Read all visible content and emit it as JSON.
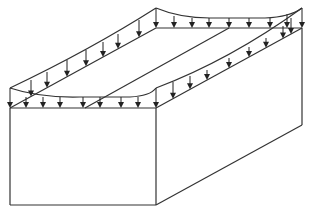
{
  "diagram": {
    "colors": {
      "stroke": "#333333",
      "background": "#ffffff"
    },
    "box": {
      "front_face": {
        "x1": 10,
        "y1": 108,
        "x2": 156,
        "y2": 205
      },
      "depth_offset": {
        "dx": 146,
        "dy": -80
      }
    },
    "mid_line": {
      "x1": 85,
      "y1": 108,
      "x2": 229,
      "y2": 28
    },
    "load_curves": [
      {
        "name": "front-load-curve",
        "d": "M10,88 Q40,98 80,97 L130,97 Q150,96 156,88"
      },
      {
        "name": "left-load-curve",
        "d": "M10,88 Q90,50 156,8"
      },
      {
        "name": "back-load-curve",
        "d": "M156,8 Q180,18 210,18 L265,18 Q290,17 302,8"
      },
      {
        "name": "right-load-curve",
        "d": "M156,88 Q230,60 302,8"
      }
    ],
    "arrows": {
      "front": [
        [
          10,
          88
        ],
        [
          26,
          97
        ],
        [
          43,
          97
        ],
        [
          60,
          97
        ],
        [
          83,
          97
        ],
        [
          100,
          97
        ],
        [
          121,
          97
        ],
        [
          138,
          97
        ],
        [
          156,
          88
        ]
      ],
      "left": [
        [
          31,
          80
        ],
        [
          47,
          72
        ],
        [
          67,
          60
        ],
        [
          86,
          50
        ],
        [
          103,
          42
        ],
        [
          118,
          34
        ],
        [
          139,
          20
        ]
      ],
      "back": [
        [
          156,
          8
        ],
        [
          174,
          16
        ],
        [
          192,
          18
        ],
        [
          209,
          18
        ],
        [
          229,
          18
        ],
        [
          249,
          18
        ],
        [
          270,
          18
        ],
        [
          287,
          14
        ],
        [
          302,
          8
        ]
      ],
      "right": [
        [
          173,
          82
        ],
        [
          190,
          76
        ],
        [
          207,
          70
        ],
        [
          229,
          58
        ],
        [
          249,
          47
        ],
        [
          266,
          38
        ],
        [
          283,
          26
        ],
        [
          291,
          18
        ]
      ]
    }
  }
}
